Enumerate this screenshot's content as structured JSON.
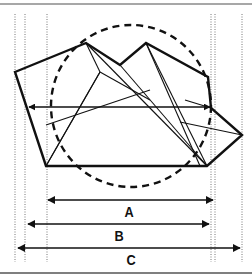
{
  "diagram": {
    "type": "geometric-measurement-figure",
    "colors": {
      "stroke": "#111111",
      "guide": "#777777",
      "border": "#8a8a8a",
      "background": "#ffffff"
    },
    "frame": {
      "top_y": 4,
      "bottom_y": 273
    },
    "guide_lines_x": [
      15,
      25,
      47,
      211,
      215,
      242
    ],
    "polygon_points": [
      [
        15,
        72
      ],
      [
        86,
        43
      ],
      [
        120,
        65
      ],
      [
        146,
        43
      ],
      [
        208,
        77
      ],
      [
        211,
        108
      ],
      [
        242,
        135
      ],
      [
        207,
        166
      ],
      [
        46,
        166
      ]
    ],
    "circle": {
      "cx": 131,
      "cy": 106,
      "rx": 80,
      "ry": 81
    },
    "inner_lines": [
      [
        [
          86,
          43
        ],
        [
          100,
          72
        ]
      ],
      [
        [
          100,
          72
        ],
        [
          46,
          166
        ]
      ],
      [
        [
          100,
          72
        ],
        [
          150,
          100
        ]
      ],
      [
        [
          146,
          43
        ],
        [
          207,
          166
        ]
      ],
      [
        [
          86,
          43
        ],
        [
          207,
          166
        ]
      ],
      [
        [
          120,
          65
        ],
        [
          207,
          166
        ]
      ],
      [
        [
          146,
          43
        ],
        [
          200,
          166
        ]
      ],
      [
        [
          46,
          125
        ],
        [
          150,
          90
        ]
      ],
      [
        [
          46,
          166
        ],
        [
          100,
          72
        ]
      ],
      [
        [
          180,
          122
        ],
        [
          242,
          135
        ]
      ],
      [
        [
          185,
          100
        ],
        [
          211,
          108
        ]
      ]
    ],
    "center_arrow": {
      "y": 107,
      "x1": 29,
      "x2": 210
    },
    "measurements": [
      {
        "label": "A",
        "y": 200,
        "x1": 48,
        "x2": 213,
        "label_x": 129,
        "label_y": 211
      },
      {
        "label": "B",
        "y": 224,
        "x1": 28,
        "x2": 209,
        "label_x": 119,
        "label_y": 235
      },
      {
        "label": "C",
        "y": 248,
        "x1": 18,
        "x2": 240,
        "label_x": 131,
        "label_y": 259
      }
    ]
  },
  "labels": {
    "a": "A",
    "b": "B",
    "c": "C"
  }
}
